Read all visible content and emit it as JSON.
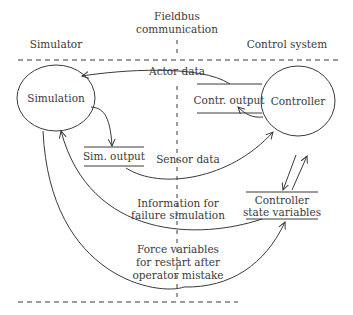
{
  "regions": {
    "left": "Simulator",
    "middle_line1": "Fieldbus",
    "middle_line2": "communication",
    "right": "Control system"
  },
  "nodes": {
    "simulation": "Simulation",
    "controller": "Controller"
  },
  "stores": {
    "contr_output": "Contr. output",
    "sim_output": "Sim. output",
    "controller_state_line1": "Controller",
    "controller_state_line2": "state variables"
  },
  "flows": {
    "actor_data": "Actor data",
    "sensor_data": "Sensor data",
    "failure_line1": "Information for",
    "failure_line2": "failure simulation",
    "force_line1": "Force variables",
    "force_line2": "for restart after",
    "force_line3": "operator mistake"
  },
  "colors": {
    "stroke": "#3a3a3a",
    "background": "#ffffff"
  }
}
